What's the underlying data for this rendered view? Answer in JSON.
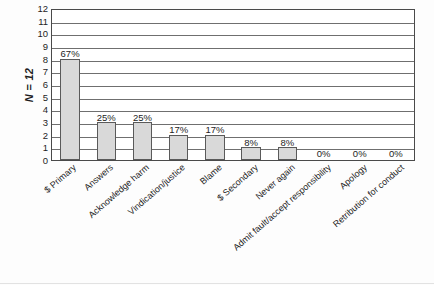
{
  "chart_data": {
    "type": "bar",
    "title": "",
    "subtitle": "",
    "xlabel": "",
    "ylabel": "N = 12",
    "ylim": [
      0,
      12
    ],
    "grid": true,
    "legend": null,
    "yticks": [
      12,
      11,
      10,
      9,
      8,
      7,
      6,
      5,
      4,
      3,
      2,
      1,
      0
    ],
    "categories": [
      "$ Primary",
      "Answers",
      "Acknowledge harm",
      "Vindication/justice",
      "Blame",
      "$ Secondary",
      "Never again",
      "Admit fault/accept responsibility",
      "Apology",
      "Retribution for conduct"
    ],
    "values": [
      8,
      3,
      3,
      2,
      2,
      1,
      1,
      0,
      0,
      0
    ],
    "data_labels": [
      "67%",
      "25%",
      "25%",
      "17%",
      "17%",
      "8%",
      "8%",
      "0%",
      "0%",
      "0%"
    ],
    "bar_color": "#d9d9d9",
    "bar_border_color": "#5a5a5a",
    "grid_color": "#6f6f6f",
    "axis_color": "#4a4a4a",
    "text_color": "#1d1d1d"
  }
}
